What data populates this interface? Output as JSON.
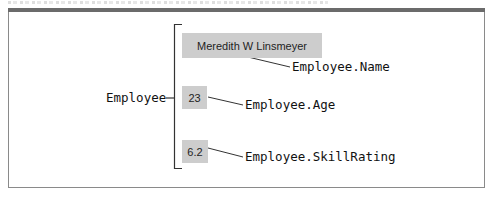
{
  "diagram": {
    "root_label": "Employee",
    "members": [
      {
        "value": "Meredith W Linsmeyer",
        "label": "Employee.Name"
      },
      {
        "value": "23",
        "label": "Employee.Age"
      },
      {
        "value": "6.2",
        "label": "Employee.SkillRating"
      }
    ]
  },
  "colors": {
    "value_box_fill": "#cdcdcd",
    "frame_bar": "#6b6b6b",
    "frame_border": "#8a8a8a",
    "line": "#333333"
  }
}
